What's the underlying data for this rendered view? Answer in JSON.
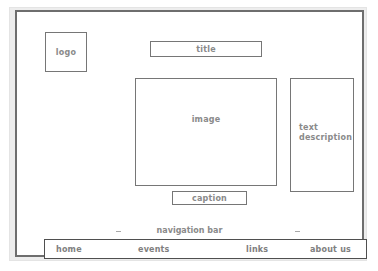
{
  "wireframe": {
    "kind": "webpage-layout-wireframe",
    "colors": {
      "page_background": "#ffffff",
      "mat": "#ededed",
      "frame_border": "#6e6e6e",
      "box_border": "#767676",
      "label_text": "#8a8a8a",
      "nav_border": "#4f4f4f",
      "nav_text": "#808080",
      "tick": "#a8a8a8"
    },
    "logo": {
      "label": "logo"
    },
    "title": {
      "label": "title"
    },
    "image": {
      "label": "image"
    },
    "text_description": {
      "label": "text\ndescription"
    },
    "caption": {
      "label": "caption"
    },
    "navigation": {
      "section_label": "navigation bar",
      "items": [
        {
          "label": "home"
        },
        {
          "label": "events"
        },
        {
          "label": "links"
        },
        {
          "label": "about us"
        }
      ]
    }
  }
}
